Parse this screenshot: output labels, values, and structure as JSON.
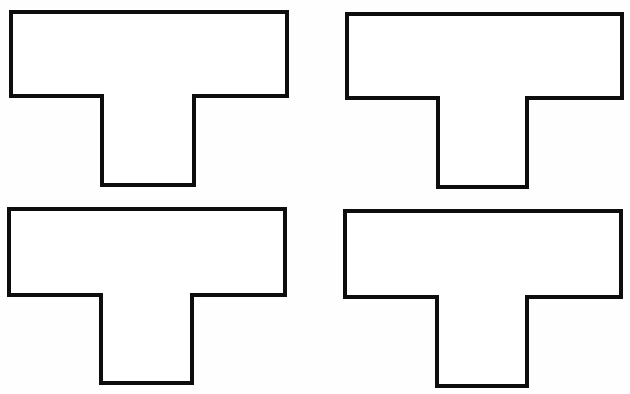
{
  "canvas": {
    "width": 630,
    "height": 394,
    "background": "#fefefe"
  },
  "style": {
    "stroke": "#0d0d0d",
    "fill": "#ffffff",
    "stroke_width": 4
  },
  "shapes": [
    {
      "name": "t-shape-top-left",
      "type": "T",
      "bar": {
        "left": 11,
        "top": 12,
        "right": 287,
        "bottom": 96
      },
      "stem": {
        "left": 102,
        "right": 194,
        "bottom": 185
      }
    },
    {
      "name": "t-shape-top-right",
      "type": "T",
      "bar": {
        "left": 347,
        "top": 14,
        "right": 622,
        "bottom": 98
      },
      "stem": {
        "left": 438,
        "right": 527,
        "bottom": 187
      }
    },
    {
      "name": "t-shape-bottom-left",
      "type": "T",
      "bar": {
        "left": 9,
        "top": 209,
        "right": 285,
        "bottom": 295
      },
      "stem": {
        "left": 101,
        "right": 192,
        "bottom": 383
      }
    },
    {
      "name": "t-shape-bottom-right",
      "type": "T",
      "bar": {
        "left": 345,
        "top": 211,
        "right": 621,
        "bottom": 297
      },
      "stem": {
        "left": 437,
        "right": 527,
        "bottom": 386
      }
    }
  ]
}
